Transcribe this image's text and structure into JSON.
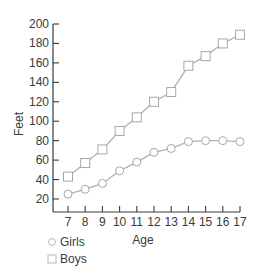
{
  "chart_data": {
    "type": "line",
    "title": "",
    "xlabel": "Age",
    "ylabel": "Feet",
    "x": [
      7,
      8,
      9,
      10,
      11,
      12,
      13,
      14,
      15,
      16,
      17
    ],
    "xticks": [
      "7",
      "8",
      "9",
      "10",
      "11",
      "12",
      "13",
      "14",
      "15",
      "16",
      "17"
    ],
    "yticks": [
      "20",
      "40",
      "60",
      "80",
      "100",
      "120",
      "140",
      "160",
      "180",
      "200"
    ],
    "ylim": [
      0,
      200
    ],
    "grid": false,
    "legend_position": "bottom-left",
    "series": [
      {
        "name": "Girls",
        "marker": "circle",
        "values": [
          25,
          30,
          36,
          49,
          58,
          68,
          72,
          79,
          80,
          80,
          79
        ]
      },
      {
        "name": "Boys",
        "marker": "square",
        "values": [
          43,
          57,
          71,
          90,
          104,
          120,
          130,
          157,
          167,
          180,
          189
        ]
      }
    ],
    "colors": {
      "line": "#b0b0b0",
      "marker_fill": "#ffffff",
      "axis": "#3a3a3a",
      "text": "#3a3a3a"
    }
  }
}
